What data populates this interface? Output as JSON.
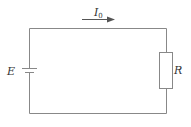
{
  "diagram": {
    "type": "circuit",
    "components": {
      "source": {
        "label": "E",
        "kind": "battery"
      },
      "resistor": {
        "label": "R",
        "kind": "resistor"
      },
      "current": {
        "label_main": "I",
        "label_sub": "0",
        "direction": "right"
      }
    },
    "colors": {
      "wire": "#888888",
      "text": "#333333",
      "background": "#ffffff"
    }
  }
}
